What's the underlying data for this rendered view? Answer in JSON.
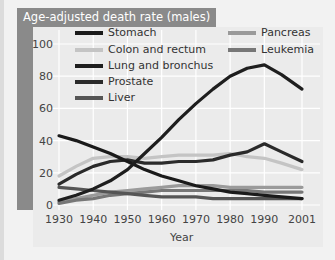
{
  "chart_data": {
    "type": "line",
    "title": "Age-adjusted death rate (males)",
    "xlabel": "Year",
    "ylabel": "Age-adjusted death rate (males)",
    "xlim": [
      1930,
      2001
    ],
    "ylim": [
      0,
      100
    ],
    "x_ticks": [
      1930,
      1940,
      1950,
      1960,
      1970,
      1980,
      1990,
      2001
    ],
    "y_ticks": [
      0,
      20,
      40,
      60,
      80,
      100
    ],
    "grid": true,
    "legend_position": "upper inside, two columns",
    "x": [
      1930,
      1935,
      1940,
      1945,
      1950,
      1955,
      1960,
      1965,
      1970,
      1975,
      1980,
      1985,
      1990,
      1995,
      2001
    ],
    "series": [
      {
        "name": "Stomach",
        "color": "#1a1a1a",
        "values": [
          43,
          40,
          36,
          32,
          27,
          22,
          18,
          15,
          12,
          10,
          8,
          7,
          6,
          5,
          4
        ]
      },
      {
        "name": "Colon and rectum",
        "color": "#c4c4c4",
        "values": [
          18,
          24,
          29,
          30,
          30,
          29,
          30,
          31,
          31,
          31,
          32,
          30,
          29,
          26,
          22
        ]
      },
      {
        "name": "Lung and bronchus",
        "color": "#1e1e1e",
        "values": [
          3,
          6,
          10,
          15,
          22,
          32,
          42,
          53,
          63,
          72,
          80,
          85,
          87,
          81,
          72
        ]
      },
      {
        "name": "Prostate",
        "color": "#2a2a2a",
        "values": [
          13,
          19,
          24,
          27,
          28,
          26,
          26,
          27,
          27,
          28,
          31,
          33,
          38,
          33,
          27
        ]
      },
      {
        "name": "Liver",
        "color": "#555555",
        "values": [
          11,
          10,
          9,
          8,
          7,
          6,
          5,
          5,
          5,
          4,
          4,
          4,
          4,
          4,
          4
        ]
      },
      {
        "name": "Pancreas",
        "color": "#9a9a9a",
        "values": [
          2,
          4,
          6,
          8,
          9,
          10,
          11,
          12,
          12,
          12,
          11,
          11,
          11,
          11,
          11
        ]
      },
      {
        "name": "Leukemia",
        "color": "#777777",
        "values": [
          1,
          3,
          4,
          6,
          7,
          8,
          9,
          9,
          9,
          9,
          9,
          9,
          8,
          8,
          8
        ]
      }
    ]
  },
  "title": "Age-adjusted death rate (males)",
  "xaxis": {
    "label": "Year",
    "ticks": [
      "1930",
      "1940",
      "1950",
      "1960",
      "1970",
      "1980",
      "1990",
      "2001"
    ]
  },
  "yaxis": {
    "ticks": [
      "0",
      "20",
      "40",
      "60",
      "80",
      "100"
    ]
  },
  "legend": [
    {
      "label": "Stomach"
    },
    {
      "label": "Colon and rectum"
    },
    {
      "label": "Lung and bronchus"
    },
    {
      "label": "Prostate"
    },
    {
      "label": "Liver"
    },
    {
      "label": "Pancreas"
    },
    {
      "label": "Leukemia"
    }
  ]
}
